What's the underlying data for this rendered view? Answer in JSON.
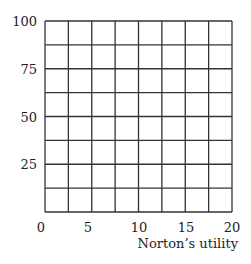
{
  "chart_data": {
    "type": "grid",
    "title": "",
    "xlabel": "Norton's utility",
    "ylabel": "",
    "xlim": [
      0,
      20
    ],
    "ylim": [
      0,
      100
    ],
    "x_ticks": [
      {
        "value": 0,
        "label": "0"
      },
      {
        "value": 5,
        "label": "5"
      },
      {
        "value": 10,
        "label": "10"
      },
      {
        "value": 15,
        "label": "15"
      },
      {
        "value": 20,
        "label": "20"
      }
    ],
    "y_ticks": [
      {
        "value": 25,
        "label": "25"
      },
      {
        "value": 50,
        "label": "50"
      },
      {
        "value": 75,
        "label": "75"
      },
      {
        "value": 100,
        "label": "100"
      }
    ],
    "grid": {
      "columns": 8,
      "rows": 8,
      "x_step": 2.5,
      "y_step": 12.5
    },
    "series": [],
    "line_color": "#333333"
  },
  "labels": {
    "xaxis_title": "Norton’s utility",
    "x": [
      "0",
      "5",
      "10",
      "15",
      "20"
    ],
    "y": [
      "100",
      "75",
      "50",
      "25"
    ]
  }
}
